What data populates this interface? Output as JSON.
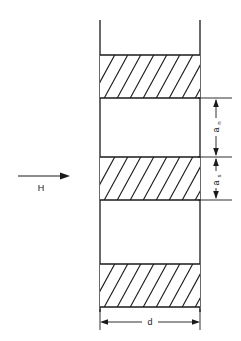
{
  "figure": {
    "type": "technical-line-diagram",
    "background_color": "#ffffff",
    "line_color": "#1a1a1a",
    "hatch_color": "#1a1a1a"
  },
  "field_arrow": {
    "label": "H",
    "direction": "right",
    "arrow_glyph": "→"
  },
  "dimensions": {
    "vertical": [
      {
        "id": "a-n",
        "base": "a",
        "subscript": "n",
        "label": "an",
        "orientation": "vertical",
        "side": "right",
        "arrow_style": "double-headed"
      },
      {
        "id": "a-s",
        "base": "a",
        "subscript": "s",
        "label": "as",
        "orientation": "vertical",
        "side": "right",
        "arrow_style": "double-headed"
      }
    ],
    "horizontal": [
      {
        "id": "d",
        "base": "d",
        "subscript": "",
        "label": "d",
        "orientation": "horizontal",
        "side": "bottom",
        "arrow_style": "double-headed"
      }
    ]
  },
  "slab": {
    "left_edge_x": 100,
    "right_edge_x": 200,
    "top_y": 20,
    "bottom_y": 312
  },
  "bands": [
    {
      "id": "band-1",
      "top": 55,
      "bottom": 98,
      "hatched": true
    },
    {
      "id": "gap-1",
      "top": 98,
      "bottom": 157,
      "hatched": false
    },
    {
      "id": "band-2",
      "top": 157,
      "bottom": 200,
      "hatched": true
    },
    {
      "id": "gap-2",
      "top": 200,
      "bottom": 264,
      "hatched": false
    },
    {
      "id": "band-3",
      "top": 264,
      "bottom": 307,
      "hatched": true
    }
  ]
}
